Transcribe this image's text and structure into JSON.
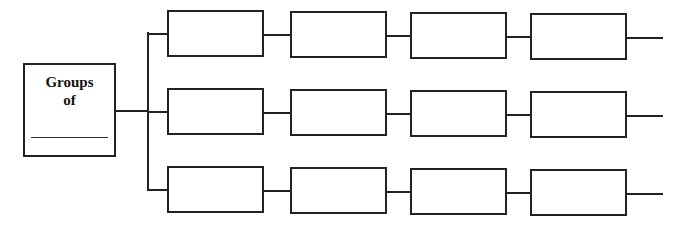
{
  "main_box": {
    "line1": "Groups",
    "line2": "of",
    "blank": ""
  },
  "rows": [
    {
      "top": 10,
      "boxes": [
        {
          "left": 167,
          "width": 97
        },
        {
          "left": 290,
          "width": 97
        },
        {
          "left": 410,
          "width": 97
        },
        {
          "left": 530,
          "width": 97
        }
      ]
    },
    {
      "top": 88,
      "boxes": [
        {
          "left": 167,
          "width": 97
        },
        {
          "left": 290,
          "width": 97
        },
        {
          "left": 410,
          "width": 97
        },
        {
          "left": 530,
          "width": 97
        }
      ]
    },
    {
      "top": 166,
      "boxes": [
        {
          "left": 167,
          "width": 97
        },
        {
          "left": 290,
          "width": 97
        },
        {
          "left": 410,
          "width": 97
        },
        {
          "left": 530,
          "width": 97
        }
      ]
    }
  ],
  "colors": {
    "stroke": "#222222",
    "background": "#ffffff"
  }
}
